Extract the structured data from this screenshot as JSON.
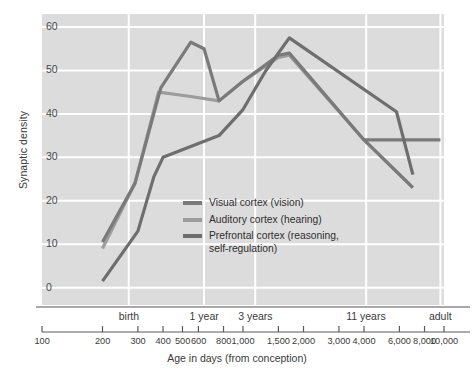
{
  "chart_data": {
    "type": "line",
    "title": "",
    "xlabel": "Age in days (from conception)",
    "ylabel": "Synaptic density",
    "x_scale": "log",
    "xlim": [
      100,
      10000
    ],
    "ylim": [
      -4,
      63
    ],
    "grid": true,
    "plot_bg": "#dcdcdc",
    "grid_color": "#ffffff",
    "legend_position": "inside-center",
    "y_ticks": [
      0,
      10,
      20,
      30,
      40,
      50,
      60
    ],
    "y_tick_labels": [
      "0",
      "10",
      "20",
      "30",
      "40",
      "50",
      "60"
    ],
    "x_ticks": [
      100,
      200,
      300,
      400,
      500,
      600,
      800,
      1000,
      1500,
      2000,
      3000,
      4000,
      6000,
      8000,
      10000
    ],
    "x_tick_labels": [
      "100",
      "200",
      "300",
      "400",
      "500",
      "600",
      "800",
      "1,000",
      "1,500",
      "2,000",
      "3,000",
      "4,000",
      "6,000",
      "8,000",
      "10,000"
    ],
    "era_labels": [
      {
        "label": "birth",
        "x": 270
      },
      {
        "label": "1 year",
        "x": 640
      },
      {
        "label": "3 years",
        "x": 1150
      },
      {
        "label": "11 years",
        "x": 4100
      },
      {
        "label": "adult",
        "x": 9600
      }
    ],
    "series": [
      {
        "name": "Visual cortex (vision)",
        "legend_label": "Visual cortex (vision)",
        "color": "#7a7a7a",
        "points": [
          {
            "x": 200,
            "y": 10.5
          },
          {
            "x": 290,
            "y": 24.0
          },
          {
            "x": 390,
            "y": 46.0
          },
          {
            "x": 550,
            "y": 56.5
          },
          {
            "x": 640,
            "y": 55.0
          },
          {
            "x": 760,
            "y": 43.0
          },
          {
            "x": 1000,
            "y": 47.5
          },
          {
            "x": 1500,
            "y": 53.5
          },
          {
            "x": 1700,
            "y": 54.0
          },
          {
            "x": 4000,
            "y": 34.0
          },
          {
            "x": 7000,
            "y": 23.0
          }
        ]
      },
      {
        "name": "Auditory cortex (hearing)",
        "legend_label": "Auditory cortex (hearing)",
        "color": "#9c9c9c",
        "points": [
          {
            "x": 200,
            "y": 9.0
          },
          {
            "x": 290,
            "y": 24.0
          },
          {
            "x": 380,
            "y": 45.0
          },
          {
            "x": 550,
            "y": 44.0
          },
          {
            "x": 760,
            "y": 43.0
          },
          {
            "x": 1000,
            "y": 47.5
          },
          {
            "x": 1500,
            "y": 53.0
          },
          {
            "x": 1700,
            "y": 53.5
          },
          {
            "x": 4000,
            "y": 34.0
          },
          {
            "x": 7000,
            "y": 23.0
          }
        ]
      },
      {
        "name": "Prefrontal cortex (reasoning, self-regulation)",
        "legend_label": "Prefrontal cortex (reasoning,\nself-regulation)",
        "color": "#6e6e6e",
        "points": [
          {
            "x": 200,
            "y": 1.5
          },
          {
            "x": 300,
            "y": 13.0
          },
          {
            "x": 360,
            "y": 25.5
          },
          {
            "x": 400,
            "y": 30.0
          },
          {
            "x": 760,
            "y": 35.0
          },
          {
            "x": 1000,
            "y": 41.0
          },
          {
            "x": 1300,
            "y": 50.0
          },
          {
            "x": 1700,
            "y": 57.5
          },
          {
            "x": 5800,
            "y": 40.5
          },
          {
            "x": 7000,
            "y": 26.0
          }
        ]
      }
    ],
    "extra_segments": [
      {
        "name": "visual-adult-plateau",
        "color": "#7a7a7a",
        "points": [
          {
            "x": 4000,
            "y": 34.0
          },
          {
            "x": 9600,
            "y": 34.0
          }
        ]
      }
    ]
  }
}
